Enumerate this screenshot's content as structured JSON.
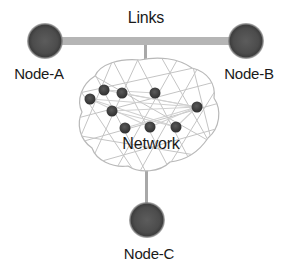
{
  "diagram": {
    "title": "Links",
    "network_label": "Network",
    "colors": {
      "link": "#b5b5b5",
      "node_outer": "#4a4a4a",
      "node_inner": "#606060",
      "cloud_outline": "#b8b8b8",
      "mesh": "#c4c4c4",
      "inner_node": "#3d3d3d",
      "text": "#1a1a1a"
    },
    "nodes": [
      {
        "id": "A",
        "label": "Node-A"
      },
      {
        "id": "B",
        "label": "Node-B"
      },
      {
        "id": "C",
        "label": "Node-C"
      }
    ],
    "links": [
      {
        "from": "Node-A",
        "to": "Node-B"
      },
      {
        "from": "Links",
        "to": "Network"
      },
      {
        "from": "Network",
        "to": "Node-C"
      }
    ],
    "network_inner_node_count": 9
  }
}
